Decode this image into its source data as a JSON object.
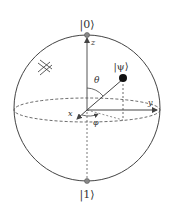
{
  "diagram": {
    "labels": {
      "ket0": "|0⟩",
      "ket1": "|1⟩",
      "psi": "|ψ⟩",
      "z_axis": "z",
      "y_axis": "y",
      "x_axis": "x",
      "theta": "θ",
      "phi": "φ"
    },
    "colors": {
      "line": "#444444",
      "pole_fill": "#888888",
      "state_fill": "#111111",
      "background": "#ffffff"
    },
    "geometry": {
      "center": [
        87,
        110
      ],
      "radius": 72,
      "equator_ry": 12,
      "psi_point": [
        123,
        78
      ]
    }
  }
}
